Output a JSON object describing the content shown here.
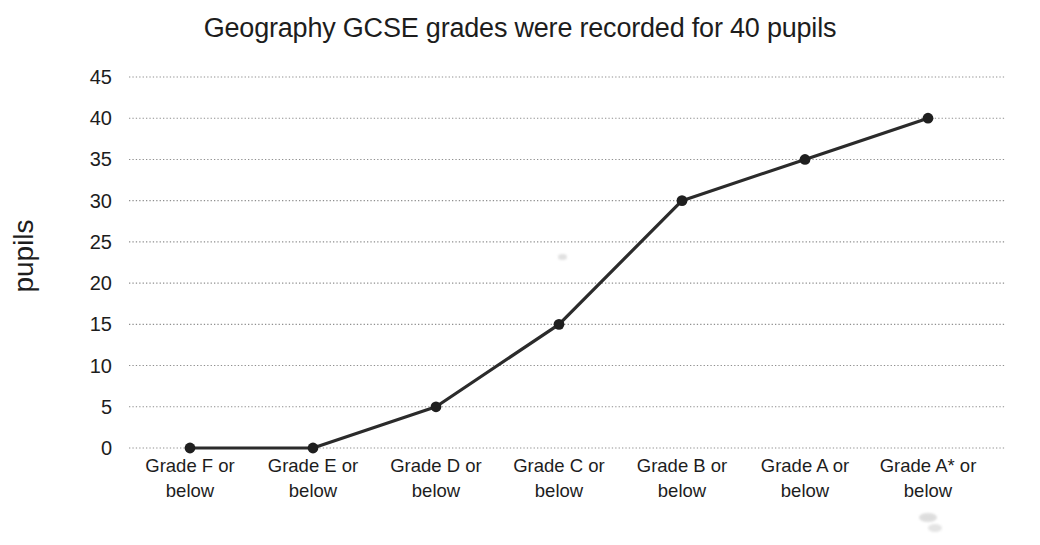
{
  "chart_data": {
    "type": "line",
    "title": "Geography GCSE grades were recorded for 40 pupils",
    "categories": [
      "Grade F or below",
      "Grade E or below",
      "Grade D or below",
      "Grade C or below",
      "Grade B or below",
      "Grade A or below",
      "Grade A* or below"
    ],
    "values": [
      0,
      0,
      5,
      15,
      30,
      35,
      40
    ],
    "series_name": "cumulative number of pupils",
    "xlabel": "",
    "ylabel": "pupils",
    "ylim": [
      0,
      45
    ],
    "yticks": [
      45,
      40,
      35,
      30,
      25,
      20,
      15,
      10,
      5,
      0
    ],
    "grid": "horizontal-dotted",
    "legend": "none",
    "colors": {
      "line": "#2b2b2b",
      "marker": "#1f1f1f",
      "gridline": "#8f8f8f",
      "text": "#1d1d1d",
      "background": "#ffffff"
    }
  }
}
